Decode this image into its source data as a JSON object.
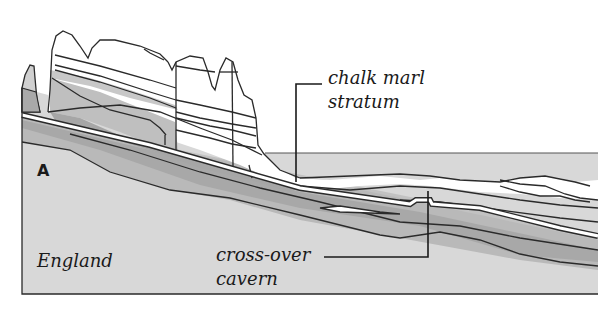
{
  "diagram": {
    "type": "geological cross-section",
    "labels": {
      "section_marker": "A",
      "region": "England",
      "stratum_line1": "chalk marl",
      "stratum_line2": "stratum",
      "cavern_line1": "cross-over",
      "cavern_line2": "cavern"
    },
    "colors": {
      "background": "#ffffff",
      "outline": "#2a2a2a",
      "light_rock": "#d6d6d6",
      "mid_rock": "#bdbdbd",
      "dark_rock": "#a3a3a3",
      "cliff_white": "#ffffff",
      "tunnel": "#ffffff"
    }
  }
}
